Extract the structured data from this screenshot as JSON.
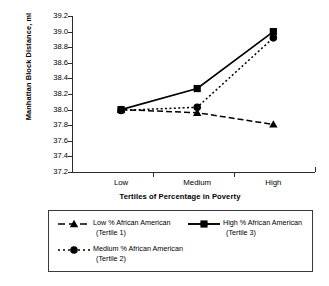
{
  "chart_data": {
    "type": "line",
    "title": "",
    "xlabel": "Tertiles of Percentage in Poverty",
    "ylabel": "Manhattan Block Distance, ml",
    "categories": [
      "Low",
      "Medium",
      "High"
    ],
    "ylim": [
      37.2,
      39.2
    ],
    "ytick_labels": [
      "39.2",
      "39.0",
      "38.8",
      "38.6",
      "38.4",
      "38.2",
      "38.0",
      "37.8",
      "37.6",
      "37.4",
      "37.2"
    ],
    "ytick_values": [
      39.2,
      39.0,
      38.8,
      38.6,
      38.4,
      38.2,
      38.0,
      37.8,
      37.6,
      37.4,
      37.2
    ],
    "grid": false,
    "legend_position": "below-plot",
    "series": [
      {
        "name": "Low % African American (Tertile 1)",
        "values": [
          38.0,
          37.96,
          37.81
        ],
        "marker": "triangle",
        "linestyle": "dashed",
        "color": "#000000"
      },
      {
        "name": "Medium % African American (Tertile 2)",
        "values": [
          37.99,
          38.03,
          38.92
        ],
        "marker": "circle",
        "linestyle": "dotted",
        "color": "#000000"
      },
      {
        "name": "High % African American (Tertile 3)",
        "values": [
          38.0,
          38.27,
          39.0
        ],
        "marker": "square",
        "linestyle": "solid",
        "color": "#000000"
      }
    ]
  },
  "axes": {
    "y_title": "Manhattan Block Distance, ml",
    "x_title": "Tertiles of Percentage in Poverty",
    "x_categories": [
      "Low",
      "Medium",
      "High"
    ],
    "y_labels": [
      "39.2",
      "39.0",
      "38.8",
      "38.6",
      "38.4",
      "38.2",
      "38.0",
      "37.8",
      "37.6",
      "37.4",
      "37.2"
    ]
  },
  "legend": {
    "entries": [
      {
        "label": "Low % African American",
        "sub": "(Tertile 1)",
        "marker": "triangle",
        "linestyle": "dashed"
      },
      {
        "label": "High % African American",
        "sub": "(Tertile 3)",
        "marker": "square",
        "linestyle": "solid"
      },
      {
        "label": "Medium % African American",
        "sub": "(Tertile 2)",
        "marker": "circle",
        "linestyle": "dotted"
      }
    ]
  },
  "colors": {
    "ink": "#000000",
    "axis": "#2b2b2b",
    "background": "#ffffff"
  }
}
